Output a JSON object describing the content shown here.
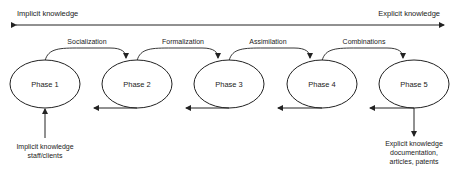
{
  "axis": {
    "left_label": "Implicit knowledge",
    "right_label": "Explicit knowledge"
  },
  "phases": [
    {
      "label": "Phase 1"
    },
    {
      "label": "Phase 2"
    },
    {
      "label": "Phase 3"
    },
    {
      "label": "Phase 4"
    },
    {
      "label": "Phase 5"
    }
  ],
  "transitions": [
    {
      "label": "Socialization"
    },
    {
      "label": "Formalization"
    },
    {
      "label": "Assimilation"
    },
    {
      "label": "Combinations"
    }
  ],
  "input": {
    "line1": "Implicit knowledge",
    "line2": "staff/clients"
  },
  "output": {
    "line1": "Explicit knowledge",
    "line2": "documentation,",
    "line3": "articles, patents"
  },
  "colors": {
    "stroke": "#222222",
    "background": "#ffffff"
  }
}
